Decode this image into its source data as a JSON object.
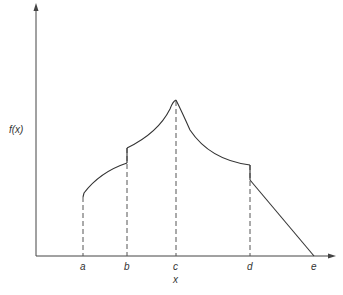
{
  "diagram": {
    "y_axis_label": "f(x)",
    "x_axis_label": "x",
    "x_ticks": [
      {
        "label": "a",
        "x": 83
      },
      {
        "label": "b",
        "x": 127
      },
      {
        "label": "c",
        "x": 176
      },
      {
        "label": "d",
        "x": 250
      },
      {
        "label": "e",
        "x": 314
      }
    ],
    "colors": {
      "line": "#333333",
      "background": "#ffffff"
    }
  }
}
